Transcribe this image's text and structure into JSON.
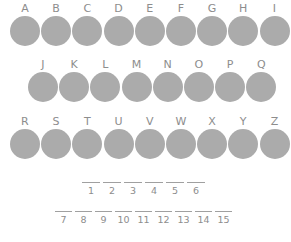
{
  "worksheet": {
    "title": "Lettered Circles Puzzle Worksheet",
    "circle_color": "#ababab",
    "text_color": "#8d8d8d",
    "rule_color": "#a0a0a0",
    "background_color": "#ffffff",
    "rows": [
      {
        "row_name": "row-1",
        "letters": [
          "A",
          "B",
          "C",
          "D",
          "E",
          "F",
          "G",
          "H",
          "I"
        ]
      },
      {
        "row_name": "row-2",
        "letters": [
          "J",
          "K",
          "L",
          "M",
          "N",
          "O",
          "P",
          "Q"
        ]
      },
      {
        "row_name": "row-3",
        "letters": [
          "R",
          "S",
          "T",
          "U",
          "V",
          "W",
          "X",
          "Y",
          "Z"
        ]
      }
    ],
    "answer_lines": [
      {
        "line_name": "answer-line-1",
        "numbers": [
          "1",
          "2",
          "3",
          "4",
          "5",
          "6"
        ],
        "values": [
          "",
          "",
          "",
          "",
          "",
          ""
        ]
      },
      {
        "line_name": "answer-line-2",
        "numbers": [
          "7",
          "8",
          "9",
          "10",
          "11",
          "12",
          "13",
          "14",
          "15"
        ],
        "values": [
          "",
          "",
          "",
          "",
          "",
          "",
          "",
          "",
          ""
        ]
      }
    ]
  }
}
